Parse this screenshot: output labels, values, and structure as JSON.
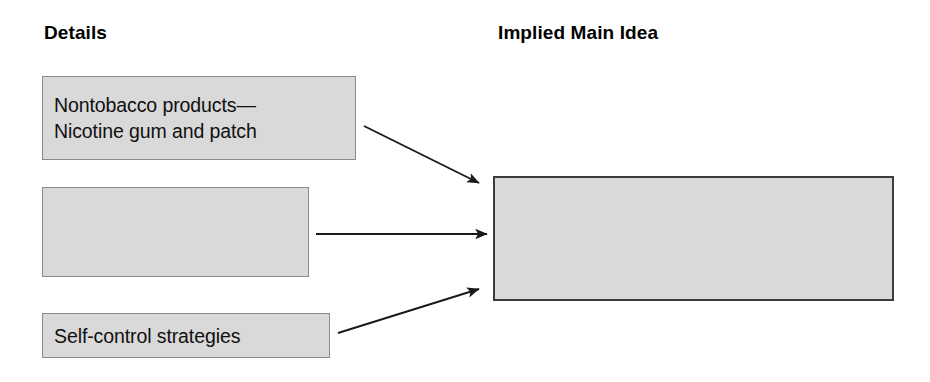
{
  "diagram": {
    "type": "implied-main-idea-graphic-organizer",
    "headings": {
      "left": "Details",
      "right": "Implied Main Idea"
    },
    "details": [
      {
        "id": "nontobacco",
        "text": "Nontobacco products—\nNicotine gum and patch",
        "filled": true
      },
      {
        "id": "blank",
        "text": "",
        "filled": false
      },
      {
        "id": "selfcontrol",
        "text": "Self-control strategies",
        "filled": true
      }
    ],
    "main_idea": {
      "id": "main-idea",
      "text": "",
      "filled": false
    },
    "arrows": [
      {
        "id": "arrow-detail-1-to-main",
        "from": "nontobacco",
        "to": "main-idea",
        "direction": "down-right"
      },
      {
        "id": "arrow-detail-2-to-main",
        "from": "blank",
        "to": "main-idea",
        "direction": "right"
      },
      {
        "id": "arrow-detail-3-to-main",
        "from": "selfcontrol",
        "to": "main-idea",
        "direction": "up-right"
      }
    ],
    "colors": {
      "box_fill": "#d9d9d9",
      "detail_border": "#8a8a8a",
      "main_border": "#3c3c3c",
      "text": "#101010",
      "arrow": "#1a1a1a",
      "background": "#ffffff"
    }
  }
}
